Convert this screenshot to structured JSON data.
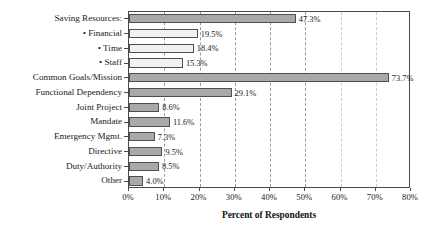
{
  "chart_data": {
    "type": "bar",
    "orientation": "horizontal",
    "title": "",
    "xlabel": "Percent of Respondents",
    "ylabel": "",
    "xlim": [
      0,
      80
    ],
    "xticks": [
      0,
      10,
      20,
      30,
      40,
      50,
      60,
      70,
      80
    ],
    "xtick_labels": [
      "0%",
      "10%",
      "20%",
      "30%",
      "40%",
      "50%",
      "60%",
      "70%",
      "80%"
    ],
    "grid": true,
    "grid_style": "dashed",
    "legend": "none",
    "value_suffix": "%",
    "categories": [
      "Saving Resources:",
      "• Financial",
      "• Time",
      "• Staff",
      "Common Goals/Mission",
      "Functional Dependency",
      "Joint Project",
      "Mandate",
      "Emergency Mgmt.",
      "Directive",
      "Duty/Authority",
      "Other"
    ],
    "values": [
      47.3,
      19.5,
      18.4,
      15.3,
      73.7,
      29.1,
      8.6,
      11.6,
      7.3,
      9.5,
      8.5,
      4.0
    ],
    "value_labels": [
      "47.3%",
      "19.5%",
      "18.4%",
      "15.3%",
      "73.7%",
      "29.1%",
      "8.6%",
      "11.6%",
      "7.3%",
      "9.5%",
      "8.5%",
      "4.0%"
    ],
    "sub_item": [
      false,
      true,
      true,
      true,
      false,
      false,
      false,
      false,
      false,
      false,
      false,
      false
    ],
    "colors": {
      "bar_primary": "#a9a9a9",
      "bar_secondary": "#f1f1f1",
      "bar_edge": "#4f4f4f",
      "axis": "#4a4a4a",
      "gridline": "#9a9a9a",
      "text": "#1a1a1a",
      "background": "#ffffff"
    }
  }
}
